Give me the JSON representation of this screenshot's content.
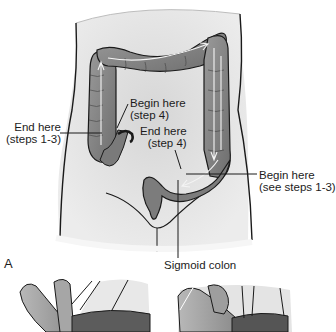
{
  "figure": {
    "panel_a": {
      "letter": "A",
      "labels": {
        "end_steps_1_3": {
          "line1": "End here",
          "line2": "(steps 1-3)"
        },
        "begin_step_4": {
          "line1": "Begin here",
          "line2": "(step 4)"
        },
        "end_step_4": {
          "line1": "End here",
          "line2": "(step 4)"
        },
        "begin_steps_1_3": {
          "line1": "Begin here",
          "line2": "(see steps 1-3)"
        },
        "sigmoid_colon": "Sigmoid colon"
      }
    },
    "colors": {
      "skin": "#e6e6e6",
      "skin_shadow": "#cfcfcf",
      "colon": "#8a8a8a",
      "colon_dark": "#5a5a5a",
      "outline": "#1a1a1a",
      "arrow": "#f4f4f4",
      "background": "#ffffff"
    }
  }
}
